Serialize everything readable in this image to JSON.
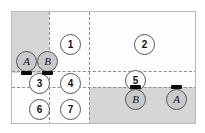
{
  "diagram": {
    "colors": {
      "shaded_zone": "#d6d6d6",
      "frame_border": "#b9b9b9",
      "partition_line": "#8d8d8d",
      "node_border": "#555555",
      "room_fill": "#ffffff",
      "agent_fill": "#c9c9c9",
      "marker": "#0d0d0d"
    },
    "zones": [
      {
        "name": "top-left-shaded",
        "label": ""
      },
      {
        "name": "bottom-right-shaded",
        "label": ""
      }
    ],
    "rooms": [
      {
        "id": "room-1",
        "label": "1"
      },
      {
        "id": "room-2",
        "label": "2"
      },
      {
        "id": "room-3",
        "label": "3"
      },
      {
        "id": "room-4",
        "label": "4"
      },
      {
        "id": "room-5",
        "label": "5"
      },
      {
        "id": "room-6",
        "label": "6"
      },
      {
        "id": "room-7",
        "label": "7"
      }
    ],
    "agents": [
      {
        "id": "agent-a-start",
        "label": "A"
      },
      {
        "id": "agent-b-start",
        "label": "B"
      },
      {
        "id": "agent-b-goal",
        "label": "B"
      },
      {
        "id": "agent-a-goal",
        "label": "A"
      }
    ]
  }
}
